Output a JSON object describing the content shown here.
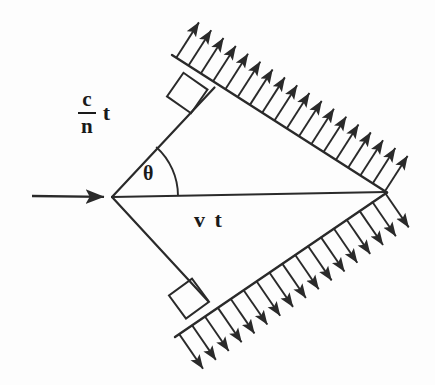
{
  "figure": {
    "background_color": "#fdfdfd",
    "ink_color": "#2a2a2a"
  },
  "labels": {
    "speed_light_medium_numerator": "c",
    "speed_light_medium_denominator": "n",
    "speed_light_medium_time": "t",
    "particle_distance": "v t",
    "cherenkov_angle": "θ"
  },
  "geometry": {
    "apex": {
      "x": 112,
      "y": 197
    },
    "right_vertex": {
      "x": 386,
      "y": 192
    },
    "incoming_arrow": {
      "x1": 32,
      "y1": 196,
      "x2": 112,
      "y2": 197
    },
    "upper_edge": {
      "x1": 112,
      "y1": 197,
      "x2": 214,
      "y2": 88
    },
    "lower_edge": {
      "x1": 112,
      "y1": 197,
      "x2": 207,
      "y2": 300
    },
    "upper_wavefront": {
      "x1": 172,
      "y1": 55,
      "x2": 386,
      "y2": 192
    },
    "lower_wavefront": {
      "x1": 175,
      "y1": 337,
      "x2": 386,
      "y2": 192
    },
    "axis_line": {
      "x1": 112,
      "y1": 197,
      "x2": 386,
      "y2": 192
    },
    "angle_arc_radius": 66,
    "upper_arrow_count": 18,
    "lower_arrow_count": 17,
    "arrow_length": 42
  }
}
